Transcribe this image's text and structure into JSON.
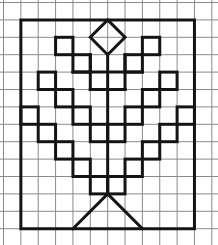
{
  "figure": {
    "width": 218,
    "height": 245,
    "background": "#ffffff",
    "grid": {
      "origin_x": 3.5,
      "origin_y": 2.5,
      "cell_w": 17.36,
      "cell_h": 17.4,
      "cols": 12,
      "rows": 13,
      "color": "#8a8a8a"
    },
    "stroke_color": "#141414",
    "frame": [
      [
        1,
        1
      ],
      [
        11,
        1
      ],
      [
        11,
        13
      ],
      [
        1,
        13
      ]
    ],
    "diamond": [
      [
        6,
        1
      ],
      [
        7,
        2
      ],
      [
        6,
        3
      ],
      [
        5,
        2
      ]
    ],
    "stem": [
      [
        6,
        3
      ],
      [
        6,
        11
      ]
    ],
    "triangle": [
      [
        4,
        13
      ],
      [
        6,
        11
      ],
      [
        8,
        13
      ]
    ],
    "cells": [
      [
        3,
        2
      ],
      [
        8,
        2
      ],
      [
        4,
        3
      ],
      [
        7,
        3
      ],
      [
        2,
        4
      ],
      [
        9,
        4
      ],
      [
        3,
        5
      ],
      [
        8,
        5
      ],
      [
        1,
        6
      ],
      [
        4,
        6
      ],
      [
        7,
        6
      ],
      [
        10,
        6
      ],
      [
        2,
        7
      ],
      [
        5,
        7
      ],
      [
        6,
        7
      ],
      [
        9,
        7
      ],
      [
        3,
        8
      ],
      [
        8,
        8
      ],
      [
        4,
        9
      ],
      [
        7,
        9
      ],
      [
        5,
        10
      ],
      [
        6,
        10
      ]
    ],
    "segments": [
      [
        [
          5,
          3
        ],
        [
          5,
          5
        ]
      ],
      [
        [
          7,
          3
        ],
        [
          7,
          5
        ]
      ],
      [
        [
          5,
          5
        ],
        [
          7,
          5
        ]
      ],
      [
        [
          4,
          4
        ],
        [
          8,
          4
        ]
      ]
    ]
  }
}
